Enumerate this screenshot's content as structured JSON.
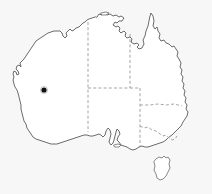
{
  "figure": {
    "kind": "locality-map",
    "region": "Australia",
    "width": 212,
    "height": 194,
    "background_color": "#f7f7f7",
    "land_fill_color": "#ffffff",
    "coastline_color": "#5a5a5a",
    "internal_border_color": "#8d8d8d",
    "internal_border_style": "dashed",
    "marker_color": "#101010",
    "title": "",
    "caption": ""
  },
  "marker": {
    "name": "locality-point",
    "shape": "filled-circle",
    "color": "#101010",
    "x": 44,
    "y": 90,
    "radius": 2.6,
    "label": ""
  },
  "regions": [
    {
      "id": "wa",
      "name": "Western Australia",
      "label": ""
    },
    {
      "id": "nt",
      "name": "Northern Territory",
      "label": ""
    },
    {
      "id": "sa",
      "name": "South Australia",
      "label": ""
    },
    {
      "id": "qld",
      "name": "Queensland",
      "label": ""
    },
    {
      "id": "nsw",
      "name": "New South Wales",
      "label": ""
    },
    {
      "id": "vic",
      "name": "Victoria",
      "label": ""
    },
    {
      "id": "tas",
      "name": "Tasmania",
      "label": ""
    }
  ],
  "borders": [
    {
      "id": "wa-nt-sa",
      "name": "wa-eastern-border",
      "style": "dashed"
    },
    {
      "id": "nt-qld",
      "name": "nt-eastern-border",
      "style": "dashed"
    },
    {
      "id": "nt-sa",
      "name": "nt-southern-border",
      "style": "dashed"
    },
    {
      "id": "sa-qld-nsw",
      "name": "sa-eastern-border",
      "style": "dashed"
    },
    {
      "id": "qld-nsw",
      "name": "qld-southern-border",
      "style": "dashed"
    },
    {
      "id": "nsw-vic",
      "name": "nsw-victoria-border",
      "style": "dashed"
    }
  ],
  "islands": [
    {
      "id": "tasmania",
      "name": "Tasmania",
      "label": ""
    },
    {
      "id": "kangaroo-island",
      "name": "Kangaroo Island",
      "label": ""
    },
    {
      "id": "melville-island",
      "name": "Melville Island",
      "label": ""
    }
  ],
  "legend": {
    "visible": false,
    "entries": []
  },
  "scalebar": {
    "visible": false,
    "text": ""
  },
  "north_arrow": {
    "visible": false,
    "label": ""
  }
}
